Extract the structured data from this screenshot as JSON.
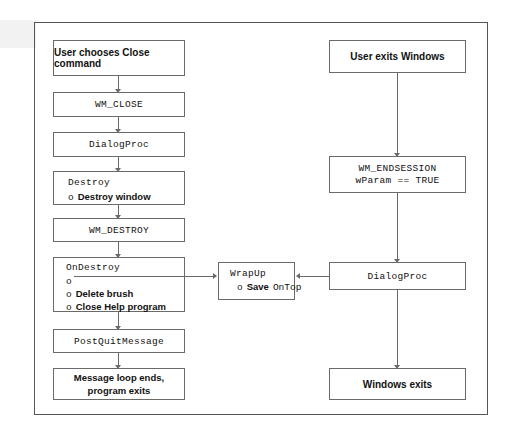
{
  "diagram": {
    "colors": {
      "ink": "#6a6a6a",
      "frame": "#565656",
      "text": "#111111",
      "paper": "#ffffff"
    },
    "left_column": [
      {
        "id": "user-close",
        "text": "User chooses Close command",
        "style": "bold"
      },
      {
        "id": "wm-close",
        "text": "WM_CLOSE",
        "style": "mono"
      },
      {
        "id": "dialogproc-left",
        "text": "DialogProc",
        "style": "mono"
      },
      {
        "id": "destroy",
        "title": "Destroy",
        "bullets": [
          {
            "marker": "o",
            "text": "Destroy window",
            "style": "bold"
          }
        ]
      },
      {
        "id": "wm-destroy",
        "text": "WM_DESTROY",
        "style": "mono"
      },
      {
        "id": "ondestroy",
        "title": "OnDestroy",
        "bullets": [
          {
            "marker": "o",
            "text": "",
            "style": "line"
          },
          {
            "marker": "o",
            "text": "Delete brush",
            "style": "bold"
          },
          {
            "marker": "o",
            "text": "Close Help program",
            "style": "bold"
          }
        ]
      },
      {
        "id": "postquitmessage",
        "text": "PostQuitMessage",
        "style": "mono"
      },
      {
        "id": "message-loop-ends",
        "line1": "Message loop ends,",
        "line2": "program exits",
        "style": "bold"
      }
    ],
    "center": {
      "id": "wrapup",
      "title": "WrapUp",
      "bullet_marker": "o",
      "bullet_bold": "Save",
      "bullet_mono": "OnTop"
    },
    "right_column": [
      {
        "id": "user-exits-windows",
        "text": "User exits Windows",
        "style": "bold"
      },
      {
        "id": "wm-endsession",
        "line1": "WM_ENDSESSION",
        "line2": "wParam == TRUE",
        "style": "mono"
      },
      {
        "id": "dialogproc-right",
        "text": "DialogProc",
        "style": "mono"
      },
      {
        "id": "windows-exits",
        "text": "Windows exits",
        "style": "bold"
      }
    ]
  }
}
